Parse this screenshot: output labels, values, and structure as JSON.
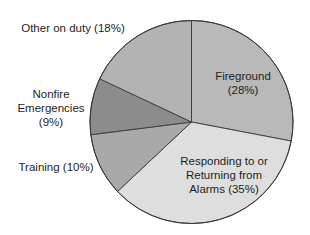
{
  "chart_data": {
    "type": "pie",
    "title": "",
    "start_angle_deg": 0,
    "direction": "clockwise",
    "slices": [
      {
        "name": "Fireground",
        "label_lines": [
          "Fireground",
          "(28%)"
        ],
        "value": 28,
        "color": "#b9b9b9"
      },
      {
        "name": "Responding to or Returning from Alarms",
        "label_lines": [
          "Responding to or",
          "Returning from",
          "Alarms (35%)"
        ],
        "value": 35,
        "color": "#dedede"
      },
      {
        "name": "Training",
        "label_lines": [
          "Training (10%)"
        ],
        "value": 10,
        "color": "#a9a9a9"
      },
      {
        "name": "Nonfire Emergencies",
        "label_lines": [
          "Nonfire",
          "Emergencies",
          "(9%)"
        ],
        "value": 9,
        "color": "#8c8c8c"
      },
      {
        "name": "Other on duty",
        "label_lines": [
          "Other on duty (18%)"
        ],
        "value": 18,
        "color": "#b3b3b3"
      }
    ],
    "legend": "none",
    "labels_position": "inside for large slices, outside-left for small slices"
  },
  "layout": {
    "cx": 191.5,
    "cy": 122,
    "r": 101.5,
    "stroke": "#3a3a3a",
    "label_positions": [
      {
        "x": 243,
        "y": [
          80,
          94
        ],
        "anchor": "middle"
      },
      {
        "x": 224,
        "y": [
          165,
          179,
          193
        ],
        "anchor": "middle"
      },
      {
        "x": 56,
        "y": [
          171
        ],
        "anchor": "middle"
      },
      {
        "x": 51,
        "y": [
          98,
          112,
          126
        ],
        "anchor": "middle"
      },
      {
        "x": 73,
        "y": [
          32
        ],
        "anchor": "middle"
      }
    ]
  }
}
